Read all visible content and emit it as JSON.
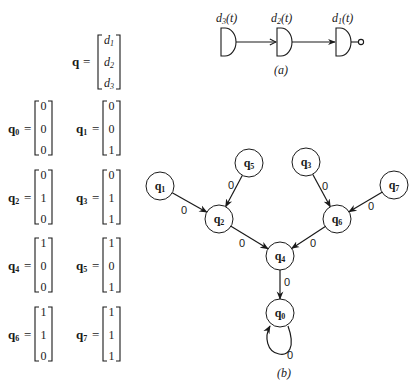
{
  "state_vector": {
    "symbol": "q",
    "equals": "=",
    "entries": [
      {
        "base": "d",
        "sub": "1"
      },
      {
        "base": "d",
        "sub": "2"
      },
      {
        "base": "d",
        "sub": "3"
      }
    ]
  },
  "states": [
    {
      "base": "q",
      "sub": "0",
      "equals": "=",
      "values": [
        "0",
        "0",
        "0"
      ]
    },
    {
      "base": "q",
      "sub": "1",
      "equals": "=",
      "values": [
        "0",
        "0",
        "1"
      ]
    },
    {
      "base": "q",
      "sub": "2",
      "equals": "=",
      "values": [
        "0",
        "1",
        "0"
      ]
    },
    {
      "base": "q",
      "sub": "3",
      "equals": "=",
      "values": [
        "0",
        "1",
        "1"
      ]
    },
    {
      "base": "q",
      "sub": "4",
      "equals": "=",
      "values": [
        "1",
        "0",
        "0"
      ]
    },
    {
      "base": "q",
      "sub": "5",
      "equals": "=",
      "values": [
        "1",
        "0",
        "1"
      ]
    },
    {
      "base": "q",
      "sub": "6",
      "equals": "=",
      "values": [
        "1",
        "1",
        "0"
      ]
    },
    {
      "base": "q",
      "sub": "7",
      "equals": "=",
      "values": [
        "1",
        "1",
        "1"
      ]
    }
  ],
  "circuit": {
    "caption": "(a)",
    "gates": [
      {
        "base": "d",
        "sub": "3",
        "arg": "(t)"
      },
      {
        "base": "d",
        "sub": "2",
        "arg": "(t)"
      },
      {
        "base": "d",
        "sub": "1",
        "arg": "(t)"
      }
    ],
    "output_icon": "inverter-bubble-icon"
  },
  "graph": {
    "caption": "(b)",
    "nodes": {
      "q0": {
        "base": "q",
        "sub": "0"
      },
      "q1": {
        "base": "q",
        "sub": "1"
      },
      "q2": {
        "base": "q",
        "sub": "2"
      },
      "q3": {
        "base": "q",
        "sub": "3"
      },
      "q4": {
        "base": "q",
        "sub": "4"
      },
      "q5": {
        "base": "q",
        "sub": "5"
      },
      "q6": {
        "base": "q",
        "sub": "6"
      },
      "q7": {
        "base": "q",
        "sub": "7"
      }
    },
    "edges": [
      {
        "from": "q1",
        "to": "q2",
        "label": "0"
      },
      {
        "from": "q5",
        "to": "q2",
        "label": "0"
      },
      {
        "from": "q2",
        "to": "q4",
        "label": "0"
      },
      {
        "from": "q3",
        "to": "q6",
        "label": "0"
      },
      {
        "from": "q7",
        "to": "q6",
        "label": "0"
      },
      {
        "from": "q6",
        "to": "q4",
        "label": "0"
      },
      {
        "from": "q4",
        "to": "q0",
        "label": "0"
      },
      {
        "from": "q0",
        "to": "q0",
        "label": "0"
      }
    ]
  }
}
